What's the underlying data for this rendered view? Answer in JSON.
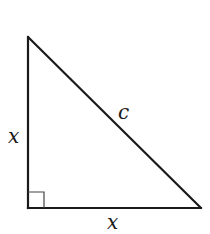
{
  "diagram": {
    "type": "right-triangle",
    "stroke_color": "#1a1a1a",
    "background": "#ffffff",
    "vertices": {
      "top": [
        28,
        37
      ],
      "right_angle": [
        28,
        208
      ],
      "bottom_right": [
        201,
        208
      ]
    },
    "right_angle_marker_size": 16,
    "labels": {
      "left_leg": "x",
      "bottom_leg": "x",
      "hypotenuse": "c"
    }
  }
}
